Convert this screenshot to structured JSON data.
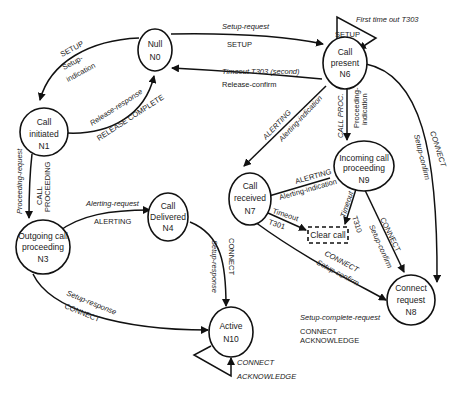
{
  "nodes": {
    "n0": {
      "line1": "Null",
      "line2": "N0"
    },
    "n1": {
      "line1": "Call",
      "line2": "initiated",
      "line3": "N1"
    },
    "n3": {
      "line1": "Outgoing call",
      "line2": "proceeding",
      "line3": "N3"
    },
    "n4": {
      "line1": "Call",
      "line2": "Delivered",
      "line3": "N4"
    },
    "n6": {
      "line1": "Call",
      "line2": "present",
      "line3": "N6"
    },
    "n7": {
      "line1": "Call",
      "line2": "received",
      "line3": "N7"
    },
    "n8": {
      "line1": "Connect",
      "line2": "request",
      "line3": "N8"
    },
    "n9": {
      "line1": "Incoming call",
      "line2": "proceeding",
      "line3": "N9"
    },
    "n10": {
      "line1": "Active",
      "line2": "N10"
    },
    "clear": {
      "label": "Clear call"
    }
  },
  "edges": {
    "n0_n1": {
      "msg": "SETUP",
      "prim1": "Setup-",
      "prim2": "indication"
    },
    "n1_n0": {
      "prim": "Release-response",
      "msg": "RELEASE COMPLETE"
    },
    "n0_n6": {
      "prim": "Setup-request",
      "msg": "SETUP"
    },
    "n6_n0": {
      "prim": "Timeout T303 (second)",
      "msg": "Release-confirm"
    },
    "n6_self": {
      "note": "First time out T303",
      "msg": "SETUP"
    },
    "n1_n3": {
      "prim": "Proceeding-request",
      "msg1": "CALL",
      "msg2": "PROCEEDING"
    },
    "n3_n4": {
      "prim": "Alerting-request",
      "msg": "ALERTING"
    },
    "n3_n10": {
      "prim": "Setup-response",
      "msg": "CONNECT"
    },
    "n4_n10": {
      "prim": "Setup-response",
      "msg": "CONNECT"
    },
    "n10_self": {
      "msg1": "CONNECT",
      "msg2": "ACKNOWLEDGE"
    },
    "n6_n7": {
      "msg": "ALERTING",
      "prim": "Alerting-indication"
    },
    "n6_n9": {
      "msg": "CALL PROC.",
      "prim1": "Proceeding-",
      "prim2": "indication"
    },
    "n6_n8": {
      "msg": "CONNECT",
      "prim": "Setup-confirm"
    },
    "n9_n7": {
      "msg": "ALERTING",
      "prim": "Alerting-indication"
    },
    "n7_clear": {
      "l1": "Timeout",
      "l2": "T301"
    },
    "n9_clear": {
      "l1": "Timeout",
      "l2": "T310"
    },
    "n9_n8": {
      "msg": "CONNECT",
      "prim": "Setup-confirm"
    },
    "n7_n8": {
      "msg": "CONNECT",
      "prim": "Setup-confirm"
    },
    "n8_complete": {
      "prim": "Setup-complete-request",
      "msg1": "CONNECT",
      "msg2": "ACKNOWLEDGE"
    }
  }
}
